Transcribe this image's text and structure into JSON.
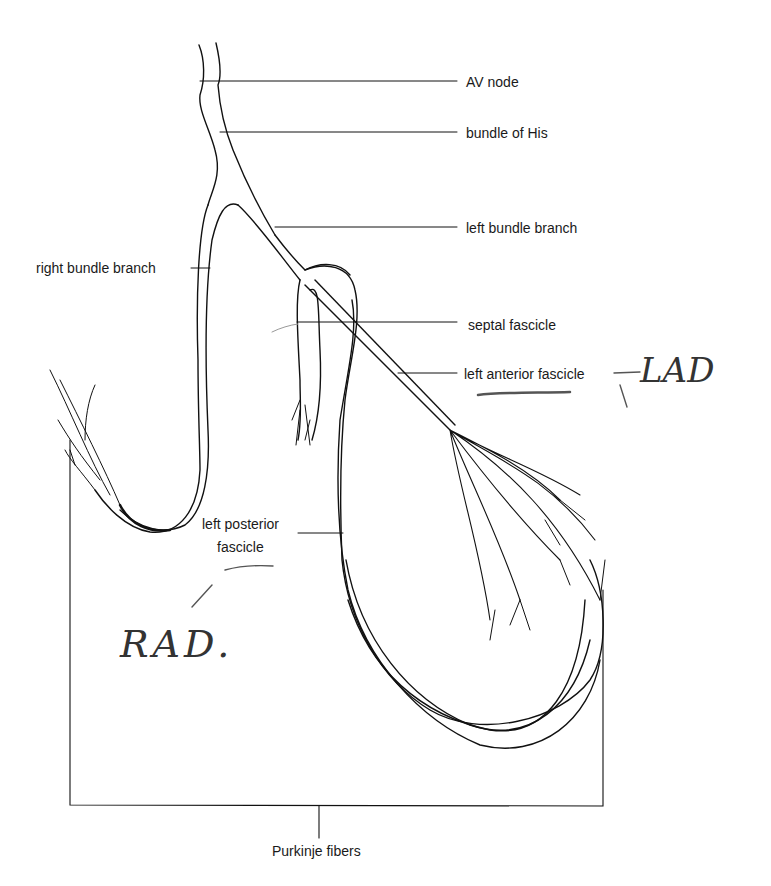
{
  "diagram": {
    "labels": {
      "av_node": "AV node",
      "bundle_of_his": "bundle of His",
      "left_bundle_branch": "left bundle branch",
      "right_bundle_branch": "right bundle branch",
      "septal_fascicle": "septal fascicle",
      "left_anterior_fascicle": "left anterior fascicle",
      "left_posterior_fascicle_line1": "left posterior",
      "left_posterior_fascicle_line2": "fascicle",
      "purkinje_fibers": "Purkinje fibers"
    },
    "handwritten_annotations": {
      "lad": "LAD",
      "rad": "RAD."
    },
    "colors": {
      "line": "#111111",
      "pencil": "#555555",
      "background": "#ffffff"
    }
  }
}
